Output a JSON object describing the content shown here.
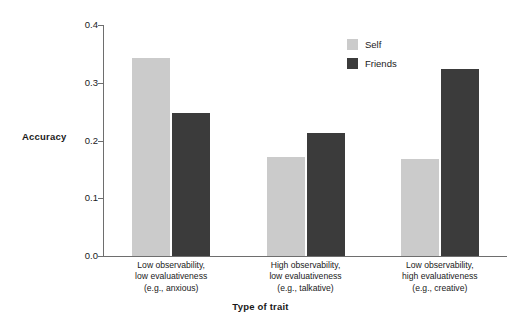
{
  "chart_data": {
    "type": "bar",
    "title": "",
    "subtitle": "",
    "xlabel": "Type of trait",
    "ylabel": "Accuracy",
    "ylim": [
      0.0,
      0.4
    ],
    "yticks": [
      "0.0",
      "0.1",
      "0.2",
      "0.3",
      "0.4"
    ],
    "ytick_values": [
      0.0,
      0.1,
      0.2,
      0.3,
      0.4
    ],
    "grid": false,
    "legend_position": "top-right",
    "categories": [
      "Low observability, low evaluativeness (e.g., anxious)",
      "High observability, low evaluativeness (e.g., talkative)",
      "Low observability, high evaluativeness (e.g., creative)"
    ],
    "category_lines": [
      [
        "Low observability,",
        "low evaluativeness",
        "(e.g., anxious)"
      ],
      [
        "High observability,",
        "low evaluativeness",
        "(e.g., talkative)"
      ],
      [
        "Low observability,",
        "high evaluativeness",
        "(e.g., creative)"
      ]
    ],
    "series": [
      {
        "name": "Self",
        "color": "#cbcbcb",
        "values": [
          0.343,
          0.171,
          0.168
        ]
      },
      {
        "name": "Friends",
        "color": "#3b3b3b",
        "values": [
          0.247,
          0.213,
          0.323
        ]
      }
    ]
  },
  "legend": {
    "items": [
      {
        "label": "Self",
        "color": "#cbcbcb"
      },
      {
        "label": "Friends",
        "color": "#3b3b3b"
      }
    ]
  },
  "axes": {
    "y_title": "Accuracy",
    "x_title": "Type of trait"
  }
}
